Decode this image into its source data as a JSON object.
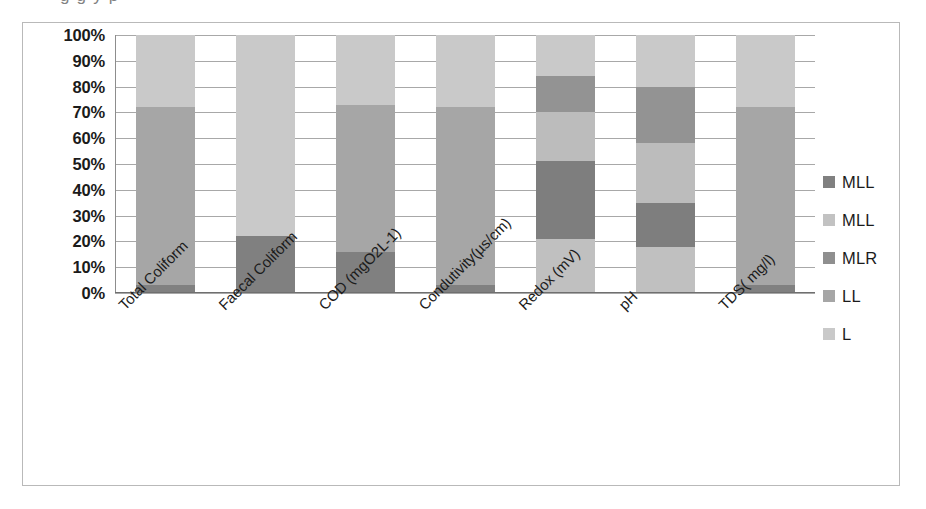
{
  "top_caption_fragment": "g                              g          y            p",
  "chart_data": {
    "type": "bar",
    "stacked": true,
    "stack_mode": "percent",
    "title": "",
    "xlabel": "",
    "ylabel": "",
    "ylim": [
      0,
      100
    ],
    "grid": true,
    "legend_position": "right",
    "categories": [
      "Total Coliform",
      "Faecal Coliform",
      "COD (mgO2L-1)",
      "Condutivity(µs/cm)",
      "Redox (mV)",
      "pH",
      "TDS( mg/l)"
    ],
    "ytick_labels": [
      "100%",
      "90%",
      "80%",
      "70%",
      "60%",
      "50%",
      "40%",
      "30%",
      "20%",
      "10%",
      "0%"
    ],
    "ytick_values": [
      100,
      90,
      80,
      70,
      60,
      50,
      40,
      30,
      20,
      10,
      0
    ],
    "series": [
      {
        "name": "MLL",
        "color": "#808080",
        "values": [
          3,
          22,
          16,
          3,
          0,
          0,
          3
        ]
      },
      {
        "name": "MLL",
        "color": "#c9c9c9",
        "values": [
          0,
          0,
          0,
          0,
          21,
          18,
          0
        ]
      },
      {
        "name": "MLR",
        "color": "#8f8f8f",
        "values": [
          0,
          0,
          0,
          0,
          30,
          17,
          0
        ]
      },
      {
        "name": "LL",
        "color": "#a6a6a6",
        "values": [
          69,
          0,
          57,
          69,
          19,
          23,
          69
        ]
      },
      {
        "name": "L",
        "color": "#c9c9c9",
        "values": [
          28,
          78,
          27,
          28,
          30,
          42,
          28
        ]
      }
    ],
    "bars": [
      {
        "category": "Total Coliform",
        "segments": [
          {
            "series": "MLL",
            "from": 0,
            "to": 3,
            "color": "#808080"
          },
          {
            "series": "LL",
            "from": 3,
            "to": 72,
            "color": "#a6a6a6"
          },
          {
            "series": "L",
            "from": 72,
            "to": 100,
            "color": "#c9c9c9"
          }
        ]
      },
      {
        "category": "Faecal Coliform",
        "segments": [
          {
            "series": "MLL",
            "from": 0,
            "to": 22,
            "color": "#808080"
          },
          {
            "series": "L",
            "from": 22,
            "to": 100,
            "color": "#c9c9c9"
          }
        ]
      },
      {
        "category": "COD (mgO2L-1)",
        "segments": [
          {
            "series": "MLL",
            "from": 0,
            "to": 16,
            "color": "#808080"
          },
          {
            "series": "LL",
            "from": 16,
            "to": 73,
            "color": "#a6a6a6"
          },
          {
            "series": "L",
            "from": 73,
            "to": 100,
            "color": "#c9c9c9"
          }
        ]
      },
      {
        "category": "Condutivity(µs/cm)",
        "segments": [
          {
            "series": "MLL",
            "from": 0,
            "to": 3,
            "color": "#808080"
          },
          {
            "series": "LL",
            "from": 3,
            "to": 72,
            "color": "#a6a6a6"
          },
          {
            "series": "L",
            "from": 72,
            "to": 100,
            "color": "#c9c9c9"
          }
        ]
      },
      {
        "category": "Redox (mV)",
        "segments": [
          {
            "series": "MLL2",
            "from": 0,
            "to": 21,
            "color": "#c0c0c0"
          },
          {
            "series": "MLR",
            "from": 21,
            "to": 51,
            "color": "#7e7e7e"
          },
          {
            "series": "LL",
            "from": 51,
            "to": 70,
            "color": "#bcbcbc"
          },
          {
            "series": "L2",
            "from": 70,
            "to": 84,
            "color": "#939393"
          },
          {
            "series": "L",
            "from": 84,
            "to": 100,
            "color": "#c9c9c9"
          }
        ]
      },
      {
        "category": "pH",
        "segments": [
          {
            "series": "MLL2",
            "from": 0,
            "to": 18,
            "color": "#c0c0c0"
          },
          {
            "series": "MLR",
            "from": 18,
            "to": 35,
            "color": "#7e7e7e"
          },
          {
            "series": "LL",
            "from": 35,
            "to": 58,
            "color": "#bcbcbc"
          },
          {
            "series": "L2",
            "from": 58,
            "to": 80,
            "color": "#939393"
          },
          {
            "series": "L",
            "from": 80,
            "to": 100,
            "color": "#c9c9c9"
          }
        ]
      },
      {
        "category": "TDS( mg/l)",
        "segments": [
          {
            "series": "MLL",
            "from": 0,
            "to": 3,
            "color": "#808080"
          },
          {
            "series": "LL",
            "from": 3,
            "to": 72,
            "color": "#a6a6a6"
          },
          {
            "series": "L",
            "from": 72,
            "to": 100,
            "color": "#c9c9c9"
          }
        ]
      }
    ],
    "legend": [
      {
        "label": "MLL",
        "color": "#808080"
      },
      {
        "label": "MLL",
        "color": "#c2c2c2"
      },
      {
        "label": "MLR",
        "color": "#8f8f8f"
      },
      {
        "label": "LL",
        "color": "#a6a6a6"
      },
      {
        "label": "L",
        "color": "#c9c9c9"
      }
    ]
  },
  "colors": {
    "grid": "#a8a8a8",
    "frame_border": "#b9b9b9",
    "axis": "#6f6f6f",
    "text": "#1b1b1b",
    "background": "#ffffff"
  }
}
